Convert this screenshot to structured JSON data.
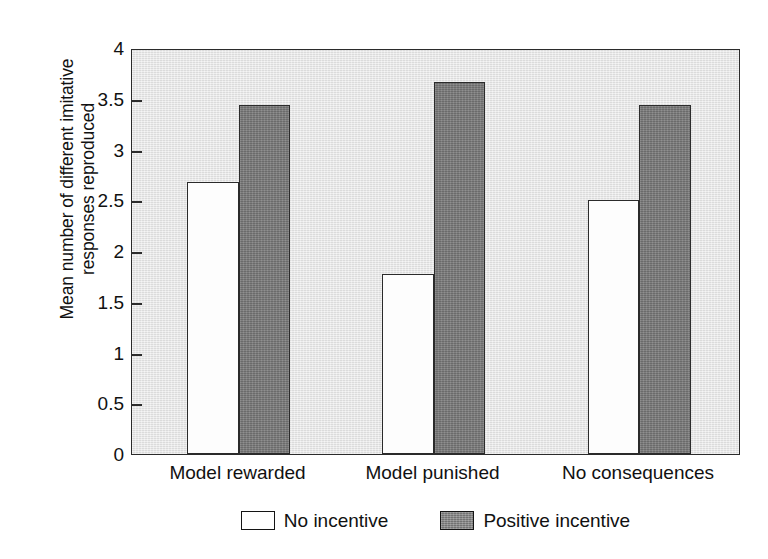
{
  "chart_data": {
    "type": "bar",
    "title": "",
    "subtitle": "",
    "xlabel": "",
    "ylabel": "Mean number of different imitative responses reproduced",
    "ylabel_lines": [
      "Mean number of different imitative",
      "responses reproduced"
    ],
    "categories": [
      "Model rewarded",
      "Model punished",
      "No consequences"
    ],
    "series": [
      {
        "name": "No incentive",
        "values": [
          2.68,
          1.77,
          2.5
        ],
        "fill": "#ffffff",
        "edge": "#2b2b2b"
      },
      {
        "name": "Positive incentive",
        "values": [
          3.44,
          3.67,
          3.44
        ],
        "fill": "#787878",
        "edge": "#2b2b2b"
      }
    ],
    "ylim": [
      0,
      4
    ],
    "yticks": [
      0,
      0.5,
      1,
      1.5,
      2,
      2.5,
      3,
      3.5,
      4
    ],
    "ytick_labels": [
      "0",
      "0.5",
      "1",
      "1.5",
      "2",
      "2.5",
      "3",
      "3.5",
      "4"
    ],
    "grid": false,
    "legend_position": "bottom",
    "plot_background": "#e4e4e4",
    "figure_background": "#ffffff"
  },
  "legend": {
    "entries": [
      {
        "label": "No incentive",
        "swatch": "light"
      },
      {
        "label": "Positive incentive",
        "swatch": "dark"
      }
    ]
  }
}
